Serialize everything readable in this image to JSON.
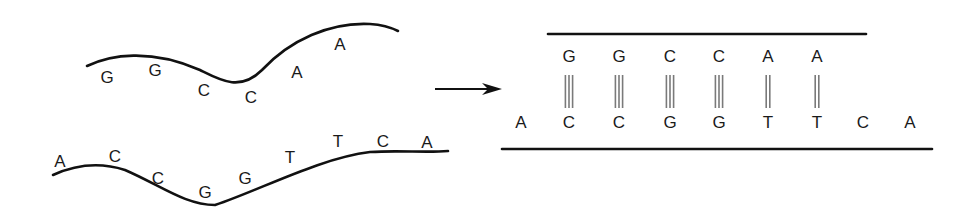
{
  "figure": {
    "left_panel": {
      "upper_strand": {
        "bases": [
          "G",
          "G",
          "C",
          "C",
          "A",
          "A"
        ],
        "positions": [
          [
            107,
            77
          ],
          [
            155,
            70
          ],
          [
            204,
            90
          ],
          [
            251,
            97
          ],
          [
            297,
            72
          ],
          [
            340,
            44
          ]
        ],
        "curve": "M87,66 C110,55 150,48 200,70 C220,80 240,92 262,70 C290,40 330,22 370,24 C385,25 392,28 398,31"
      },
      "lower_strand": {
        "bases": [
          "A",
          "C",
          "C",
          "G",
          "G",
          "T",
          "T",
          "C",
          "A"
        ],
        "positions": [
          [
            60,
            161
          ],
          [
            115,
            156
          ],
          [
            158,
            178
          ],
          [
            205,
            192
          ],
          [
            245,
            178
          ],
          [
            290,
            157
          ],
          [
            338,
            141
          ],
          [
            383,
            141
          ],
          [
            427,
            142
          ]
        ],
        "curve": "M53,175 C75,165 100,162 125,170 C160,185 185,205 215,205 C260,190 320,158 370,152 C400,150 425,153 448,151"
      }
    },
    "arrow": {
      "x1": 435,
      "y1": 89,
      "x2": 502,
      "y2": 89,
      "direction": "right"
    },
    "right_panel": {
      "top_backbone": {
        "x1": 548,
        "x2": 866,
        "y": 34
      },
      "bottom_backbone": {
        "x1": 502,
        "x2": 932,
        "y": 149
      },
      "top_row": [
        "G",
        "G",
        "C",
        "C",
        "A",
        "A"
      ],
      "top_row_x": [
        569,
        619,
        670,
        719,
        768,
        817
      ],
      "top_row_y": 56,
      "bottom_row": [
        "A",
        "C",
        "C",
        "G",
        "G",
        "T",
        "T",
        "C",
        "A"
      ],
      "bottom_row_x": [
        521,
        569,
        619,
        670,
        719,
        768,
        817,
        863,
        910
      ],
      "bottom_row_y": 122,
      "bonds": [
        {
          "pair": "G-C",
          "count": 3
        },
        {
          "pair": "G-C",
          "count": 3
        },
        {
          "pair": "C-G",
          "count": 3
        },
        {
          "pair": "C-G",
          "count": 3
        },
        {
          "pair": "A-T",
          "count": 2
        },
        {
          "pair": "A-T",
          "count": 2
        }
      ],
      "bond_y1": 75,
      "bond_y2": 108
    },
    "colors": {
      "line": "#111111",
      "text": "#1a1a1a",
      "bond": "#7a7a7a",
      "background": "#ffffff"
    }
  }
}
